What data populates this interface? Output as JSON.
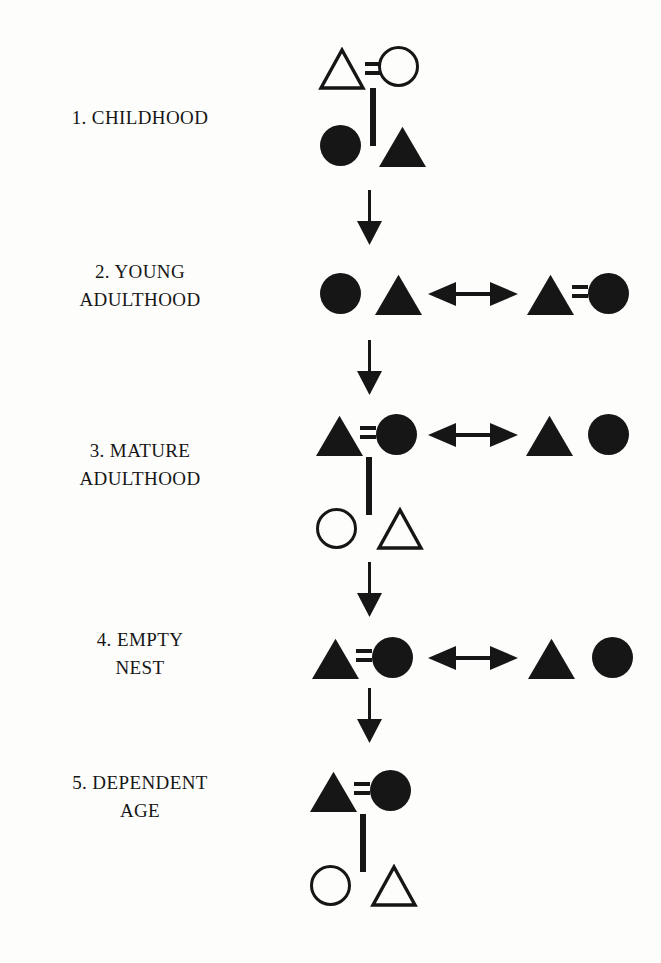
{
  "diagram": {
    "background_color": "#fdfdfb",
    "ink_color": "#161616",
    "legend_semantics": {
      "open_triangle": "male (non-focal / child generation)",
      "open_circle": "female (non-focal / child generation)",
      "filled_triangle": "male (focal generation)",
      "filled_circle": "female (focal generation)",
      "equals_sign": "marriage",
      "vertical_line": "descent / parent-child link",
      "double_arrow": "relationship between households",
      "down_arrow": "transition to next stage"
    },
    "stages": [
      {
        "id": "stage-1",
        "number": "1.",
        "label": "1. CHILDHOOD",
        "label_lines": [
          "1. CHILDHOOD"
        ],
        "parents": [
          {
            "shape": "triangle",
            "fill": "open"
          },
          {
            "shape": "circle",
            "fill": "open"
          }
        ],
        "marriage_link": true,
        "descent_line": true,
        "children": [
          {
            "shape": "circle",
            "fill": "filled"
          },
          {
            "shape": "triangle",
            "fill": "filled"
          }
        ],
        "second_household": null,
        "double_arrow": false,
        "transition_arrow": true
      },
      {
        "id": "stage-2",
        "number": "2.",
        "label": "2. YOUNG ADULTHOOD",
        "label_lines": [
          "2. YOUNG",
          "ADULTHOOD"
        ],
        "parents": [
          {
            "shape": "circle",
            "fill": "filled"
          },
          {
            "shape": "triangle",
            "fill": "filled"
          }
        ],
        "marriage_link": false,
        "descent_line": false,
        "children": [],
        "second_household": [
          {
            "shape": "triangle",
            "fill": "filled"
          },
          {
            "shape": "circle",
            "fill": "filled"
          }
        ],
        "second_household_marriage": true,
        "double_arrow": true,
        "transition_arrow": true
      },
      {
        "id": "stage-3",
        "number": "3.",
        "label": "3. MATURE ADULTHOOD",
        "label_lines": [
          "3. MATURE",
          "ADULTHOOD"
        ],
        "parents": [
          {
            "shape": "triangle",
            "fill": "filled"
          },
          {
            "shape": "circle",
            "fill": "filled"
          }
        ],
        "marriage_link": true,
        "descent_line": true,
        "children": [
          {
            "shape": "circle",
            "fill": "open"
          },
          {
            "shape": "triangle",
            "fill": "open"
          }
        ],
        "second_household": [
          {
            "shape": "triangle",
            "fill": "filled"
          },
          {
            "shape": "circle",
            "fill": "filled"
          }
        ],
        "second_household_marriage": false,
        "double_arrow": true,
        "transition_arrow": true
      },
      {
        "id": "stage-4",
        "number": "4.",
        "label": "4. EMPTY NEST",
        "label_lines": [
          "4. EMPTY",
          "NEST"
        ],
        "parents": [
          {
            "shape": "triangle",
            "fill": "filled"
          },
          {
            "shape": "circle",
            "fill": "filled"
          }
        ],
        "marriage_link": true,
        "descent_line": false,
        "children": [],
        "second_household": [
          {
            "shape": "triangle",
            "fill": "filled"
          },
          {
            "shape": "circle",
            "fill": "filled"
          }
        ],
        "second_household_marriage": false,
        "double_arrow": true,
        "transition_arrow": true
      },
      {
        "id": "stage-5",
        "number": "5.",
        "label": "5. DEPENDENT AGE",
        "label_lines": [
          "5. DEPENDENT",
          "AGE"
        ],
        "parents": [
          {
            "shape": "triangle",
            "fill": "filled"
          },
          {
            "shape": "circle",
            "fill": "filled"
          }
        ],
        "marriage_link": true,
        "descent_line": true,
        "children": [
          {
            "shape": "circle",
            "fill": "open"
          },
          {
            "shape": "triangle",
            "fill": "open"
          }
        ],
        "second_household": null,
        "double_arrow": false,
        "transition_arrow": false
      }
    ]
  }
}
